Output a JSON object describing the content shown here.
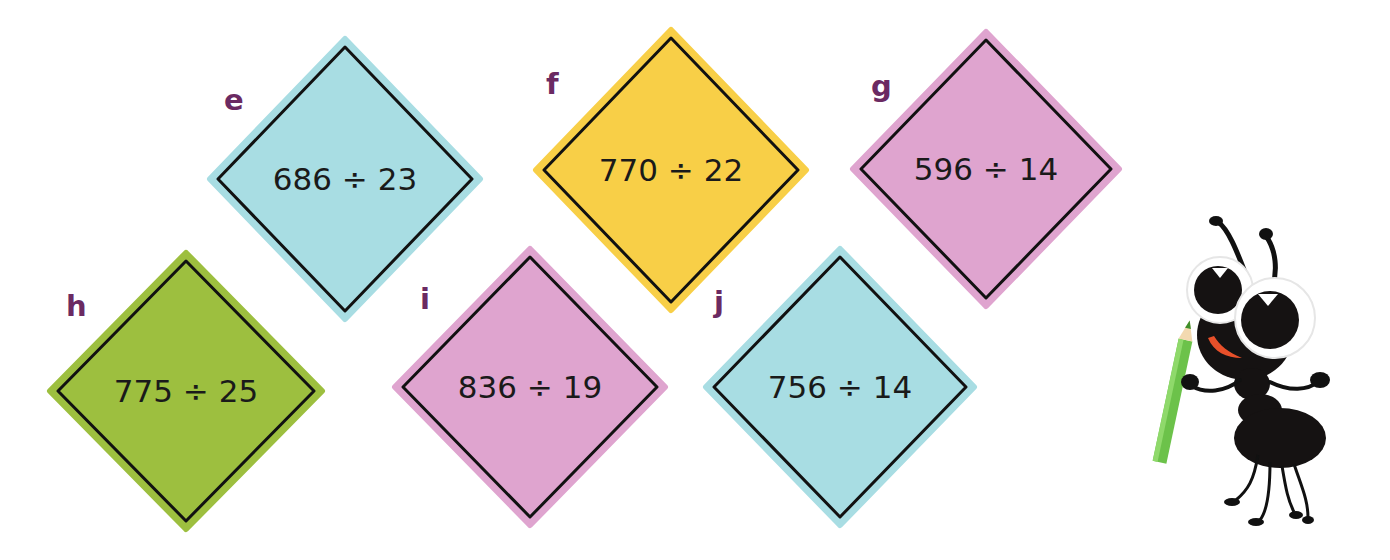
{
  "problems": [
    {
      "label": "e",
      "expression": "686 ÷ 23",
      "color": "#a8dde3",
      "cx": 345,
      "cy": 179,
      "hw": 135,
      "hh": 140,
      "label_x": 224,
      "label_y": 86
    },
    {
      "label": "f",
      "expression": "770 ÷ 22",
      "color": "#f8cf47",
      "cx": 671,
      "cy": 170,
      "hw": 135,
      "hh": 140,
      "label_x": 546,
      "label_y": 70
    },
    {
      "label": "g",
      "expression": "596 ÷ 14",
      "color": "#dfa4cf",
      "cx": 986,
      "cy": 169,
      "hw": 133,
      "hh": 137,
      "label_x": 871,
      "label_y": 72
    },
    {
      "label": "h",
      "expression": "775 ÷ 25",
      "color": "#9dbf3f",
      "cx": 186,
      "cy": 391,
      "hw": 136,
      "hh": 138,
      "label_x": 66,
      "label_y": 292
    },
    {
      "label": "i",
      "expression": "836 ÷ 19",
      "color": "#dfa4cf",
      "cx": 530,
      "cy": 387,
      "hw": 135,
      "hh": 138,
      "label_x": 420,
      "label_y": 285
    },
    {
      "label": "j",
      "expression": "756 ÷ 14",
      "color": "#a8dde3",
      "cx": 840,
      "cy": 387,
      "hw": 134,
      "hh": 138,
      "label_x": 714,
      "label_y": 288
    }
  ],
  "mascot": {
    "description": "cartoon ant holding a green pencil"
  }
}
